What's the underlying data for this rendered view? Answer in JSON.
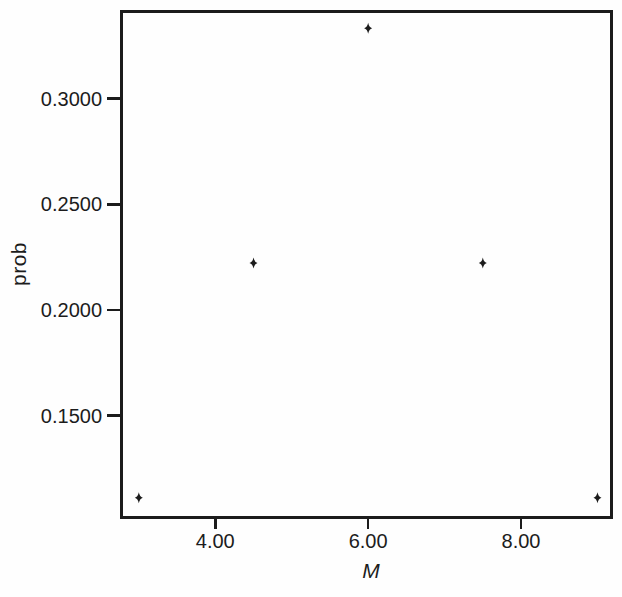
{
  "figure": {
    "background": "#fefefe",
    "ink": "#1c1c1c"
  },
  "chart_data": {
    "type": "scatter",
    "title": "",
    "xlabel": "M",
    "ylabel": "prob",
    "marker": "filled-diamond",
    "marker_color": "#1c1c1c",
    "grid": false,
    "legend": "none",
    "points": [
      {
        "x": 3.0,
        "prob": 0.1111
      },
      {
        "x": 4.5,
        "prob": 0.2222
      },
      {
        "x": 6.0,
        "prob": 0.3333
      },
      {
        "x": 7.5,
        "prob": 0.2222
      },
      {
        "x": 9.0,
        "prob": 0.1111
      }
    ],
    "axes": {
      "xlim": [
        2.78,
        9.19
      ],
      "ylim": [
        0.102,
        0.341
      ],
      "x_ticks": [
        {
          "value": 4.0,
          "label": "4.00"
        },
        {
          "value": 6.0,
          "label": "6.00"
        },
        {
          "value": 8.0,
          "label": "8.00"
        }
      ],
      "y_ticks": [
        {
          "value": 0.3,
          "label": "0.3000"
        },
        {
          "value": 0.25,
          "label": "0.2500"
        },
        {
          "value": 0.2,
          "label": "0.2000"
        },
        {
          "value": 0.15,
          "label": "0.1500"
        }
      ]
    }
  }
}
